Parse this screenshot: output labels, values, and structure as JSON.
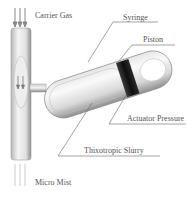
{
  "diagram": {
    "type": "technical-illustration",
    "labels": {
      "carrier_gas": "Carrier Gas",
      "syringe": "Syringe",
      "piston": "Piston",
      "actuator_pressure": "Actuator Pressure",
      "thixotropic_slurry": "Thixotropic Slurry",
      "micro_mist": "Micro Mist"
    },
    "colors": {
      "background": "#ffffff",
      "label_text": "#555555",
      "leader_line": "#666666",
      "tube_light": "#f2f2f2",
      "tube_shade": "#9a9a9a",
      "piston": "#1a1a1a",
      "arrow": "#8a8a8a"
    }
  }
}
